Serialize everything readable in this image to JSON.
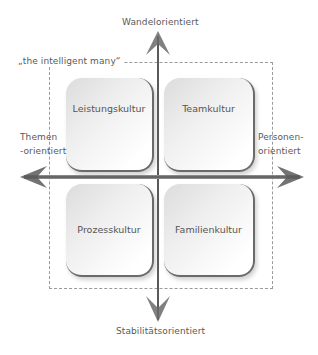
{
  "title_top": "Wandelorientiert",
  "title_bottom": "Stabilitätsorientiert",
  "left_label_line1": "Themen",
  "left_label_line2": "-orientiert",
  "right_label_line1": "Personen-",
  "right_label_line2": "orientiert",
  "frame_label": "„the intelligent many“",
  "quadrants": {
    "top_left": "Leistungskultur",
    "top_right": "Teamkultur",
    "bottom_left": "Prozesskultur",
    "bottom_right": "Familienkultur"
  },
  "colors": {
    "axis": "#555555",
    "text": "#5a5a5a",
    "frame": "#9a9a9a"
  }
}
